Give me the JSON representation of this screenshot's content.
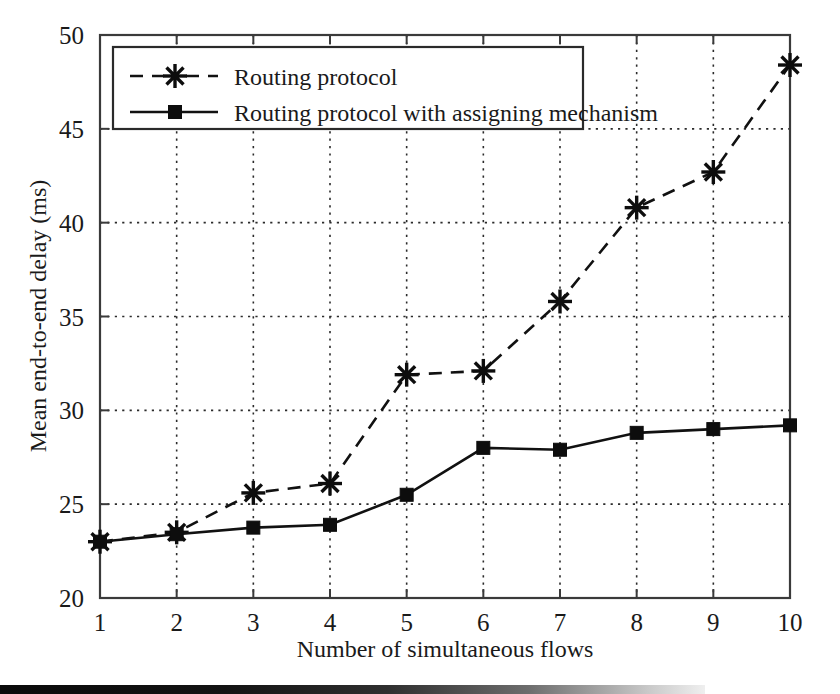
{
  "chart_data": {
    "type": "line",
    "title": "",
    "xlabel": "Number of simultaneous flows",
    "ylabel": "Mean end-to-end delay (ms)",
    "x": [
      1,
      2,
      3,
      4,
      5,
      6,
      7,
      8,
      9,
      10
    ],
    "xticklabels": [
      "1",
      "2",
      "3",
      "4",
      "5",
      "6",
      "7",
      "8",
      "9",
      "10"
    ],
    "yticks": [
      20,
      25,
      30,
      35,
      40,
      45,
      50
    ],
    "yticklabels": [
      "20",
      "25",
      "30",
      "35",
      "40",
      "45",
      "50"
    ],
    "xlim": [
      1,
      10
    ],
    "ylim": [
      20,
      50
    ],
    "grid": true,
    "legend_position": "upper-left",
    "series": [
      {
        "name": "Routing protocol",
        "marker": "star",
        "linestyle": "dashed",
        "color": "#111111",
        "values": [
          23.0,
          23.5,
          25.6,
          26.1,
          31.9,
          32.1,
          35.8,
          40.8,
          42.7,
          48.4
        ]
      },
      {
        "name": "Routing protocol with assigning mechanism",
        "marker": "square",
        "linestyle": "solid",
        "color": "#111111",
        "values": [
          23.0,
          23.4,
          23.75,
          23.9,
          25.5,
          28.0,
          27.9,
          28.8,
          29.0,
          29.2
        ]
      }
    ]
  },
  "legend": {
    "entries": [
      {
        "label": "Routing protocol"
      },
      {
        "label": "Routing protocol with assigning mechanism"
      }
    ]
  },
  "colors": {
    "ink": "#111111",
    "grid": "#2b2b2b",
    "background": "#ffffff"
  }
}
